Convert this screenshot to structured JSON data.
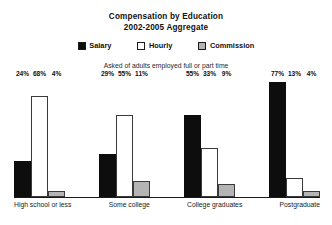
{
  "chart_data": {
    "type": "bar",
    "title": "Compensation by Education",
    "subtitle": "2002-2005 Aggregate",
    "annotation": "Asked of adults employed full or part time",
    "xlabel": "",
    "ylabel": "",
    "ylim": [
      0,
      80
    ],
    "grid": false,
    "legend_position": "top-center",
    "value_suffix": "%",
    "categories": [
      "High school or less",
      "Some college",
      "College graduates",
      "Postgraduate"
    ],
    "series": [
      {
        "name": "Salary",
        "color": "#0d0d0d",
        "values": [
          24,
          29,
          55,
          77
        ],
        "labels": [
          "24%",
          "29%",
          "55%",
          "77%"
        ]
      },
      {
        "name": "Hourly",
        "color": "#ffffff",
        "values": [
          68,
          55,
          33,
          13
        ],
        "labels": [
          "68%",
          "55%",
          "33%",
          "13%"
        ]
      },
      {
        "name": "Commission",
        "color": "#b4b4b4",
        "values": [
          4,
          11,
          9,
          4
        ],
        "labels": [
          "4%",
          "11%",
          "9%",
          "4%"
        ]
      }
    ]
  },
  "legend": {
    "items": [
      {
        "label": "Salary"
      },
      {
        "label": "Hourly"
      },
      {
        "label": "Commission"
      }
    ]
  }
}
